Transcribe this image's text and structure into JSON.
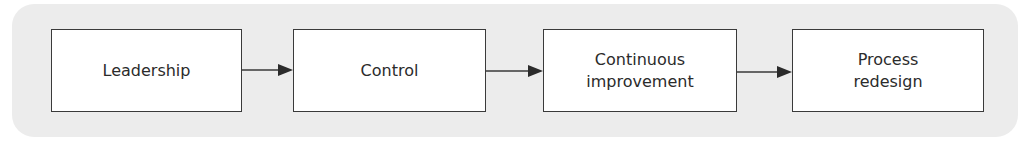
{
  "diagram": {
    "type": "flow",
    "direction": "left-to-right",
    "nodes": [
      {
        "id": "leadership",
        "lines": [
          "Leadership"
        ]
      },
      {
        "id": "control",
        "lines": [
          "Control"
        ]
      },
      {
        "id": "continuous-improvement",
        "lines": [
          "Continuous",
          "improvement"
        ]
      },
      {
        "id": "process-redesign",
        "lines": [
          "Process",
          "redesign"
        ]
      }
    ],
    "edges": [
      {
        "from": "leadership",
        "to": "control"
      },
      {
        "from": "control",
        "to": "continuous-improvement"
      },
      {
        "from": "continuous-improvement",
        "to": "process-redesign"
      }
    ],
    "colors": {
      "panel": "#ececec",
      "box_fill": "#ffffff",
      "stroke": "#3a3a3a",
      "text": "#2b2b2b"
    }
  }
}
